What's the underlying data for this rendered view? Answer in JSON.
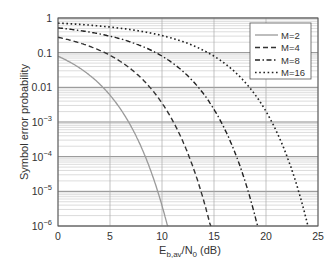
{
  "chart_data": {
    "type": "line",
    "title": "",
    "xlabel": "E_b,av/N_0 (dB)",
    "xlabel_parts": {
      "main": "E",
      "sub1": "b,av",
      "mid": "/N",
      "sub2": "0",
      "tail": " (dB)"
    },
    "ylabel": "Symbol error probability",
    "xlim": [
      0,
      25
    ],
    "ylim": [
      1e-06,
      1
    ],
    "yscale": "log",
    "grid": true,
    "x_ticks": [
      "0",
      "5",
      "10",
      "15",
      "20",
      "25"
    ],
    "y_ticks": [
      {
        "base": "1",
        "exp": ""
      },
      {
        "base": "0.1",
        "exp": ""
      },
      {
        "base": "0.01",
        "exp": ""
      },
      {
        "base": "10",
        "exp": "−3"
      },
      {
        "base": "10",
        "exp": "−4"
      },
      {
        "base": "10",
        "exp": "−5"
      },
      {
        "base": "10",
        "exp": "−6"
      }
    ],
    "legend_position": "upper right",
    "series": [
      {
        "name": "M=2",
        "style": "solid",
        "M": 2,
        "x": [
          0,
          2,
          4,
          6,
          8,
          9,
          10,
          10.5
        ],
        "values": [
          0.079,
          0.038,
          0.0125,
          0.0024,
          0.00019,
          3.4e-05,
          3.9e-06,
          1e-06
        ]
      },
      {
        "name": "M=4",
        "style": "dashed",
        "M": 4,
        "x": [
          0,
          4,
          8,
          10,
          12,
          13,
          14,
          14.4
        ],
        "values": [
          0.3,
          0.17,
          0.05,
          0.016,
          0.0024,
          0.0005,
          6e-05,
          1e-06
        ]
      },
      {
        "name": "M=8",
        "style": "dashdot",
        "M": 8,
        "x": [
          0,
          5,
          10,
          13,
          15,
          17,
          18.5,
          19.2
        ],
        "values": [
          0.55,
          0.4,
          0.18,
          0.06,
          0.015,
          0.0015,
          4e-05,
          1e-06
        ]
      },
      {
        "name": "M=16",
        "style": "dotted",
        "M": 16,
        "x": [
          0,
          5,
          10,
          15,
          18,
          20,
          22,
          23.5,
          24
        ],
        "values": [
          0.8,
          0.72,
          0.5,
          0.22,
          0.07,
          0.016,
          0.0012,
          2e-05,
          1e-06
        ]
      }
    ]
  }
}
